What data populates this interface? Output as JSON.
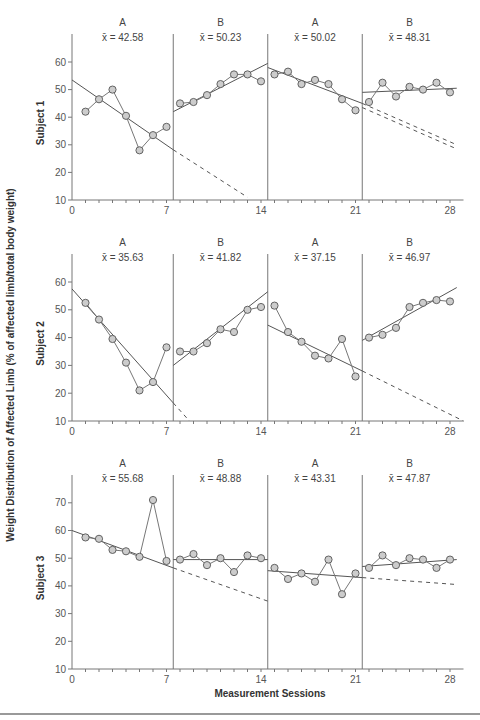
{
  "chart_data": {
    "type": "line",
    "title": "",
    "xlabel": "Measurement Sessions",
    "ylabel": "Weight Distribution of Affected Limb (% of affected limb/total body weight)",
    "x_ticks": [
      0,
      7,
      14,
      21,
      28
    ],
    "xlim": [
      0,
      29
    ],
    "phase_change_positions": [
      7.5,
      14.5,
      21.5
    ],
    "phases": [
      "A",
      "B",
      "A",
      "B"
    ],
    "grid": false,
    "legend": null,
    "panels": [
      {
        "subject": "Subject 1",
        "ylim": [
          10,
          70
        ],
        "y_ticks": [
          10,
          20,
          30,
          40,
          50,
          60
        ],
        "phases": [
          {
            "label": "A",
            "mean_label": "x̄ = 42.58",
            "mean": 42.58,
            "sessions": [
              1,
              2,
              3,
              4,
              5,
              6,
              7
            ],
            "values": [
              42,
              46.5,
              50,
              40.5,
              28,
              33.5,
              36.5
            ],
            "trend": {
              "x0": 0,
              "y0": 53.5,
              "x1": 7.5,
              "y1": 28.2
            },
            "projection": {
              "x0": 7.5,
              "y0": 28.2,
              "x1": 13,
              "y1": 11
            }
          },
          {
            "label": "B",
            "mean_label": "x̄ = 50.23",
            "mean": 50.23,
            "sessions": [
              8,
              9,
              10,
              11,
              12,
              13,
              14
            ],
            "values": [
              45,
              45.5,
              48,
              52,
              55.5,
              55.5,
              53
            ],
            "trend": {
              "x0": 7.5,
              "y0": 42,
              "x1": 14.5,
              "y1": 59.5
            }
          },
          {
            "label": "A",
            "mean_label": "x̄ = 50.02",
            "mean": 50.02,
            "sessions": [
              15,
              16,
              17,
              18,
              19,
              20,
              21
            ],
            "values": [
              55.5,
              56.5,
              52,
              53.5,
              52,
              46.5,
              42.5
            ],
            "trend": {
              "x0": 14.5,
              "y0": 58,
              "x1": 21.5,
              "y1": 45
            },
            "projection": {
              "x0": 21.5,
              "y0": 45,
              "x1": 28.5,
              "y1": 30
            },
            "projection2": {
              "x0": 21.5,
              "y0": 43.5,
              "x1": 28.5,
              "y1": 28.5
            }
          },
          {
            "label": "B",
            "mean_label": "x̄ = 48.31",
            "mean": 48.31,
            "sessions": [
              22,
              23,
              24,
              25,
              26,
              27,
              28
            ],
            "values": [
              45.5,
              52.5,
              47.5,
              51,
              50,
              52.5,
              49
            ],
            "trend": {
              "x0": 21.5,
              "y0": 49,
              "x1": 28.5,
              "y1": 50.5
            }
          }
        ]
      },
      {
        "subject": "Subject 2",
        "ylim": [
          10,
          70
        ],
        "y_ticks": [
          10,
          20,
          30,
          40,
          50,
          60
        ],
        "phases": [
          {
            "label": "A",
            "mean_label": "x̄ = 35.63",
            "mean": 35.63,
            "sessions": [
              1,
              2,
              3,
              4,
              5,
              6,
              7
            ],
            "values": [
              52.5,
              46.5,
              39.5,
              31,
              21,
              24,
              36.5
            ],
            "trend": {
              "x0": 0,
              "y0": 57.5,
              "x1": 7.5,
              "y1": 16.5
            },
            "projection": {
              "x0": 7.5,
              "y0": 16.5,
              "x1": 8.7,
              "y1": 10
            }
          },
          {
            "label": "B",
            "mean_label": "x̄ = 41.82",
            "mean": 41.82,
            "sessions": [
              8,
              9,
              10,
              11,
              12,
              13,
              14
            ],
            "values": [
              35,
              35,
              38,
              43,
              42,
              50,
              51
            ],
            "trend": {
              "x0": 7.5,
              "y0": 30,
              "x1": 14.5,
              "y1": 56.5
            }
          },
          {
            "label": "A",
            "mean_label": "x̄ = 37.15",
            "mean": 37.15,
            "sessions": [
              15,
              16,
              17,
              18,
              19,
              20,
              21
            ],
            "values": [
              51.5,
              42,
              38.5,
              33.5,
              32.5,
              39.5,
              26
            ],
            "trend": {
              "x0": 14.5,
              "y0": 44.5,
              "x1": 21.5,
              "y1": 28
            },
            "projection": {
              "x0": 21.5,
              "y0": 28,
              "x1": 29,
              "y1": 10
            }
          },
          {
            "label": "B",
            "mean_label": "x̄ = 46.97",
            "mean": 46.97,
            "sessions": [
              22,
              23,
              24,
              25,
              26,
              27,
              28
            ],
            "values": [
              40,
              41,
              43.5,
              51,
              52.5,
              53.5,
              53
            ],
            "trend": {
              "x0": 21.5,
              "y0": 39,
              "x1": 28.5,
              "y1": 58
            }
          }
        ]
      },
      {
        "subject": "Subject 3",
        "ylim": [
          10,
          80
        ],
        "y_ticks": [
          10,
          20,
          30,
          40,
          50,
          60,
          70
        ],
        "phases": [
          {
            "label": "A",
            "mean_label": "x̄ = 55.68",
            "mean": 55.68,
            "sessions": [
              1,
              2,
              3,
              4,
              5,
              6,
              7
            ],
            "values": [
              57.5,
              57,
              53,
              52.5,
              50.5,
              71,
              49
            ],
            "trend": {
              "x0": 0,
              "y0": 60,
              "x1": 7.5,
              "y1": 46.5
            },
            "projection": {
              "x0": 7.5,
              "y0": 46.5,
              "x1": 14.5,
              "y1": 34.5
            }
          },
          {
            "label": "B",
            "mean_label": "x̄ = 48.88",
            "mean": 48.88,
            "sessions": [
              8,
              9,
              10,
              11,
              12,
              13,
              14
            ],
            "values": [
              49.5,
              51.5,
              47.5,
              50,
              45,
              51,
              50
            ],
            "trend": {
              "x0": 7.5,
              "y0": 49.5,
              "x1": 14.5,
              "y1": 49.5
            }
          },
          {
            "label": "A",
            "mean_label": "x̄ = 43.31",
            "mean": 43.31,
            "sessions": [
              15,
              16,
              17,
              18,
              19,
              20,
              21
            ],
            "values": [
              46.5,
              42.5,
              44.5,
              41.5,
              49.5,
              37,
              44.5
            ],
            "trend": {
              "x0": 14.5,
              "y0": 45.5,
              "x1": 21.5,
              "y1": 43
            },
            "projection": {
              "x0": 21.5,
              "y0": 43,
              "x1": 28.5,
              "y1": 40.5
            }
          },
          {
            "label": "B",
            "mean_label": "x̄ = 47.87",
            "mean": 47.87,
            "sessions": [
              22,
              23,
              24,
              25,
              26,
              27,
              28
            ],
            "values": [
              46.5,
              51,
              47.5,
              50,
              49.5,
              46.5,
              49.5
            ],
            "trend": {
              "x0": 21.5,
              "y0": 47,
              "x1": 28.5,
              "y1": 49.5
            }
          }
        ]
      }
    ]
  },
  "colors": {
    "axis": "#777777",
    "line": "#555555",
    "marker_fill": "#cccccc",
    "marker_stroke": "#555555",
    "text": "#444444"
  }
}
